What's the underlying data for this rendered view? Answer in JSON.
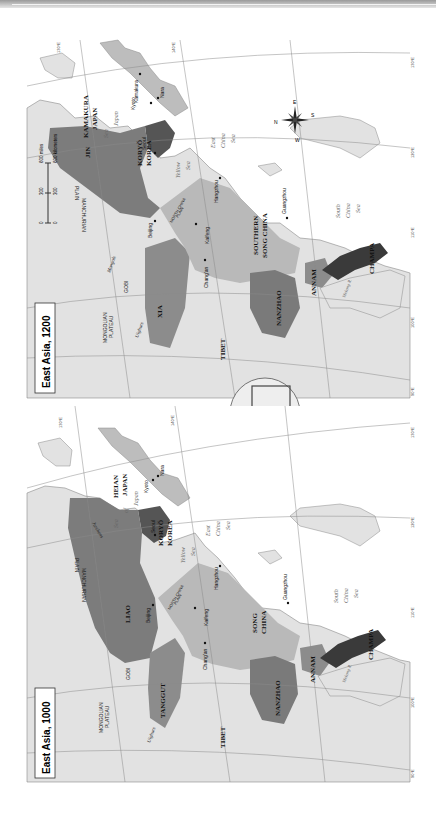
{
  "maps": [
    {
      "title": "East Asia, 1200",
      "states": {
        "jin": "JIN",
        "xia": "XIA",
        "koryo": "KORYŎ",
        "korea": "KOREA",
        "kamakura": "KAMAKURA",
        "japan": "JAPAN",
        "southern": "SOUTHERN",
        "song_china": "SONG CHINA",
        "nanzhao": "NANZHAO",
        "annam": "ANNAM",
        "champa": "CHAMPA",
        "tibet": "TIBET"
      },
      "regions": {
        "mongolian": "MONGOLIAN",
        "plateau": "PLATEAU",
        "gobi": "GOBI",
        "manchurian": "MANCHURIAN",
        "plain": "PLAIN",
        "north_china": "NORTH CHINA",
        "north_china_plain": "PLAIN",
        "uighurs": "Uighurs",
        "mongols": "Mongols"
      },
      "cities": {
        "beijing": "Beijing",
        "kaifeng": "Kaifeng",
        "changan": "Chang'an",
        "hangzhou": "Hangzhou",
        "guangzhou": "Guangzhou",
        "seoul": "Seoul",
        "kyoto": "Kyoto",
        "nara": "Nara",
        "kamakura": "Kamakura"
      },
      "water": {
        "sea_of_japan": [
          "Sea",
          "of",
          "Japan"
        ],
        "yellow_sea": [
          "Yellow",
          "Sea"
        ],
        "east_china_sea": [
          "East",
          "China",
          "Sea"
        ],
        "south_china_sea": [
          "South",
          "China",
          "Sea"
        ],
        "mekong": "Mekong R.",
        "yellow_r": "Yellow R.",
        "yangzi": "Yangzi R.",
        "ganges": "Ganges R.",
        "xi": "Xi R."
      },
      "graticule": [
        "130°E",
        "140°E",
        "120°E",
        "110°E",
        "100°E",
        "90°E",
        "50°N",
        "40°N",
        "30°N",
        "20°N"
      ],
      "scale": {
        "miles_label": "600 miles",
        "km_label": "600 kilometers",
        "ticks_miles": [
          "0",
          "300",
          "600"
        ],
        "ticks_km": [
          "0",
          "300",
          "600"
        ]
      },
      "compass": {
        "n": "N",
        "s": "S",
        "e": "E",
        "w": "W"
      }
    },
    {
      "title": "East Asia, 1000",
      "states": {
        "liao": "LIAO",
        "tanggut": "TANGGUT",
        "koryo": "KORYŎ",
        "korea": "KOREA",
        "heian": "HEIAN",
        "japan": "JAPAN",
        "song": "SONG",
        "china": "CHINA",
        "nanzhao": "NANZHAO",
        "annam": "ANNAM",
        "champa": "CHAMPA",
        "tibet": "TIBET"
      },
      "regions": {
        "mongolian": "MONGOLIAN",
        "plateau": "PLATEAU",
        "gobi": "GOBI",
        "manchurian": "MANCHURIAN",
        "plain": "PLAIN",
        "north_china": "NORTH CHINA",
        "north_china_plain": "PLAIN",
        "uighurs": "Uighurs",
        "jurchens": "Jurchens"
      },
      "cities": {
        "beijing": "Beijing",
        "kaifeng": "Kaifeng",
        "changan": "Chang'an",
        "hangzhou": "Hangzhou",
        "guangzhou": "Guangzhou",
        "seoul": "Seoul",
        "kyoto": "Kyoto",
        "nara": "Nara"
      },
      "water": {
        "sea_of_japan": [
          "Sea",
          "of",
          "Japan"
        ],
        "yellow_sea": [
          "Yellow",
          "Sea"
        ],
        "east_china_sea": [
          "East",
          "China",
          "Sea"
        ],
        "south_china_sea": [
          "South",
          "China",
          "Sea"
        ],
        "mekong": "Mekong R.",
        "yellow_r": "Yellow R.",
        "yangzi": "Yangzi R.",
        "ganges": "Ganges R."
      },
      "graticule": [
        "130°E",
        "140°E",
        "120°E",
        "110°E",
        "100°E",
        "90°E",
        "40°N",
        "30°N"
      ]
    }
  ],
  "colors": {
    "land": "#e2e2e2",
    "water": "#ffffff",
    "state_dark": "#6e6e6e",
    "state_mid": "#8c8c8c",
    "state_light": "#b9b9b9",
    "korea": "#555555",
    "champa": "#3a3a3a",
    "grid": "#8a8a8a"
  }
}
